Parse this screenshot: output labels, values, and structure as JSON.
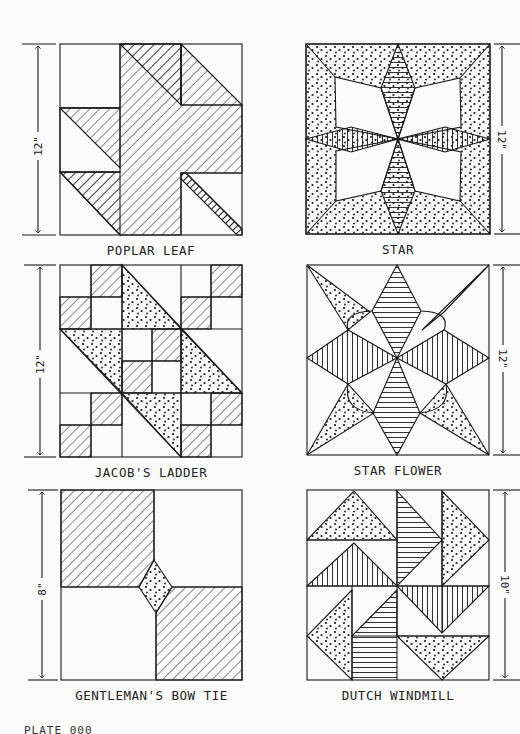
{
  "page": {
    "plate_label": "PLATE 000"
  },
  "blocks": [
    {
      "name": "POPLAR LEAF",
      "size": "12\"",
      "dimension_side": "left"
    },
    {
      "name": "STAR",
      "size": "12\"",
      "dimension_side": "right"
    },
    {
      "name": "JACOB'S LADDER",
      "size": "12\"",
      "dimension_side": "left"
    },
    {
      "name": "STAR FLOWER",
      "size": "12\"",
      "dimension_side": "right"
    },
    {
      "name": "GENTLEMAN'S BOW TIE",
      "size": "8\"",
      "dimension_side": "left"
    },
    {
      "name": "DUTCH WINDMILL",
      "size": "10\"",
      "dimension_side": "right"
    }
  ],
  "colors": {
    "ink": "#1a1a1a",
    "paper": "#fbfbfb"
  }
}
